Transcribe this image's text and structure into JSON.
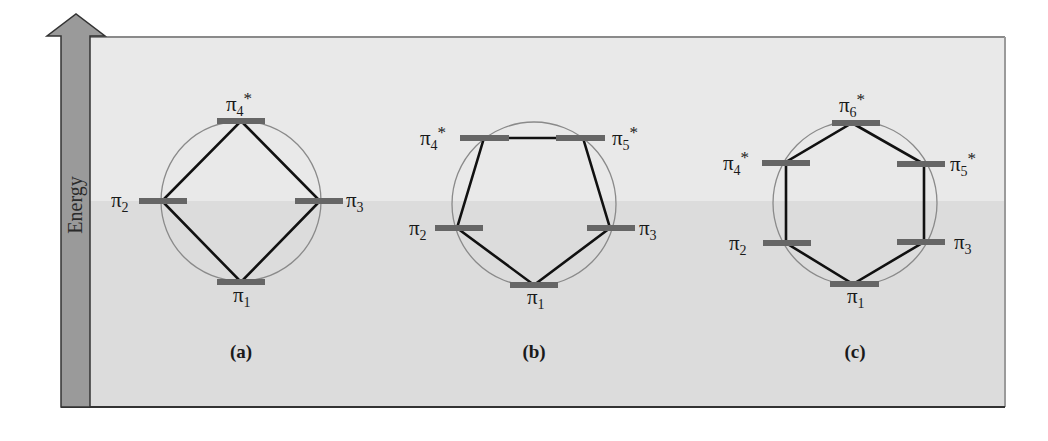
{
  "figure": {
    "axis_label": "Energy",
    "colors": {
      "background": "#ffffff",
      "upper_band": "#e9e9e9",
      "lower_band": "#dcdcdc",
      "arrow": "#9a9a9a",
      "level_bar": "#666666",
      "polygon_edge": "#111111",
      "circle": "#8a8a8a",
      "border": "#555555"
    },
    "panels": [
      {
        "caption": "(a)",
        "ring_size": 4,
        "levels": [
          {
            "label": "π",
            "subscript": "1",
            "star": "",
            "position": "bottom"
          },
          {
            "label": "π",
            "subscript": "2",
            "star": "",
            "position": "left"
          },
          {
            "label": "π",
            "subscript": "3",
            "star": "",
            "position": "right"
          },
          {
            "label": "π",
            "subscript": "4",
            "star": "*",
            "position": "top"
          }
        ]
      },
      {
        "caption": "(b)",
        "ring_size": 5,
        "levels": [
          {
            "label": "π",
            "subscript": "1",
            "star": "",
            "position": "bottom"
          },
          {
            "label": "π",
            "subscript": "2",
            "star": "",
            "position": "lower-left"
          },
          {
            "label": "π",
            "subscript": "3",
            "star": "",
            "position": "lower-right"
          },
          {
            "label": "π",
            "subscript": "4",
            "star": "*",
            "position": "upper-left"
          },
          {
            "label": "π",
            "subscript": "5",
            "star": "*",
            "position": "upper-right"
          }
        ]
      },
      {
        "caption": "(c)",
        "ring_size": 6,
        "levels": [
          {
            "label": "π",
            "subscript": "1",
            "star": "",
            "position": "bottom"
          },
          {
            "label": "π",
            "subscript": "2",
            "star": "",
            "position": "lower-left"
          },
          {
            "label": "π",
            "subscript": "3",
            "star": "",
            "position": "lower-right"
          },
          {
            "label": "π",
            "subscript": "4",
            "star": "*",
            "position": "upper-left"
          },
          {
            "label": "π",
            "subscript": "5",
            "star": "*",
            "position": "upper-right"
          },
          {
            "label": "π",
            "subscript": "6",
            "star": "*",
            "position": "top"
          }
        ]
      }
    ]
  }
}
